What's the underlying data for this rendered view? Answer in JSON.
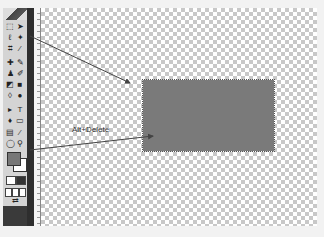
{
  "toolbox": {
    "tools": [
      {
        "name": "marquee-tool",
        "glyph": "⬚"
      },
      {
        "name": "move-tool",
        "glyph": "➤"
      },
      {
        "name": "lasso-tool",
        "glyph": "ℓ"
      },
      {
        "name": "magic-wand-tool",
        "glyph": "✦"
      },
      {
        "name": "crop-tool",
        "glyph": "⌗"
      },
      {
        "name": "slice-tool",
        "glyph": "⁄"
      },
      {
        "name": "healing-brush-tool",
        "glyph": "✚"
      },
      {
        "name": "brush-tool",
        "glyph": "✎"
      },
      {
        "name": "clone-stamp-tool",
        "glyph": "♟"
      },
      {
        "name": "history-brush-tool",
        "glyph": "✐"
      },
      {
        "name": "eraser-tool",
        "glyph": "◩"
      },
      {
        "name": "gradient-tool",
        "glyph": "■"
      },
      {
        "name": "blur-tool",
        "glyph": "◊"
      },
      {
        "name": "dodge-tool",
        "glyph": "●"
      },
      {
        "name": "path-selection-tool",
        "glyph": "▸"
      },
      {
        "name": "type-tool",
        "glyph": "T"
      },
      {
        "name": "pen-tool",
        "glyph": "♦"
      },
      {
        "name": "shape-tool",
        "glyph": "▭"
      },
      {
        "name": "notes-tool",
        "glyph": "▤"
      },
      {
        "name": "eyedropper-tool",
        "glyph": "⁄"
      },
      {
        "name": "hand-tool",
        "glyph": "◯"
      },
      {
        "name": "zoom-tool",
        "glyph": "⚲"
      }
    ],
    "foreground_color": "#777777",
    "background_color": "#ffffff"
  },
  "ruler": {
    "marks": [
      "1",
      "2",
      "3",
      "4",
      "5",
      "6",
      "7"
    ]
  },
  "canvas": {
    "fill_color": "#7a7a7a",
    "annotation": "Alt+Delete"
  }
}
